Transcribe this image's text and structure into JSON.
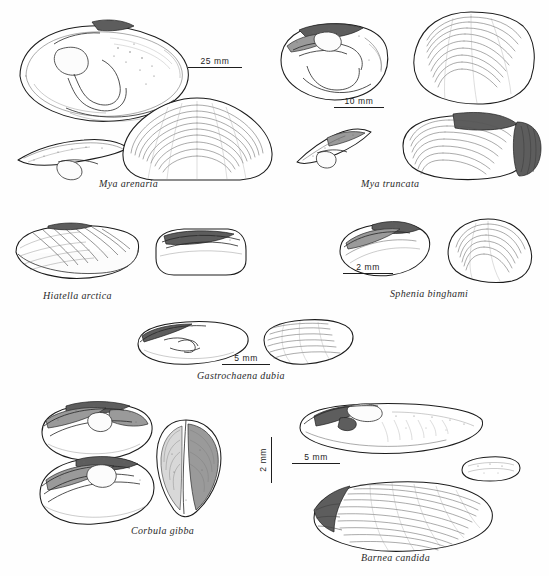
{
  "plate": {
    "title": "Bivalve shell identification plate",
    "background_color": "#ffffff",
    "ink_color": "#1c1c1c",
    "species_count": 6
  },
  "species": [
    {
      "id": "mya-arenaria",
      "label": "Mya arenaria",
      "scale": {
        "text": "25 mm",
        "orientation": "horizontal"
      },
      "views": [
        "left valve interior with chondrophore",
        "hinge plate detail",
        "right valve exterior"
      ]
    },
    {
      "id": "mya-truncata",
      "label": "Mya truncata",
      "scale": {
        "text": "10 mm",
        "orientation": "horizontal"
      },
      "views": [
        "left valve interior with chondrophore",
        "hinge plate detail",
        "valve exterior",
        "valve with periostracum"
      ]
    },
    {
      "id": "hiatella-arctica",
      "label": "Hiatella arctica",
      "scale": {
        "text": "2 mm",
        "orientation": "vertical"
      },
      "views": [
        "exterior",
        "interior"
      ]
    },
    {
      "id": "sphenia-binghami",
      "label": "Sphenia binghami",
      "scale": {
        "text": "2 mm",
        "orientation": "horizontal"
      },
      "views": [
        "interior",
        "exterior"
      ]
    },
    {
      "id": "gastrochaena-dubia",
      "label": "Gastrochaena dubia",
      "scale": {
        "text": "5 mm",
        "orientation": "horizontal"
      },
      "views": [
        "interior",
        "exterior"
      ]
    },
    {
      "id": "corbula-gibba",
      "label": "Corbula gibba",
      "scale": {
        "text": "5 mm",
        "orientation": "vertical"
      },
      "views": [
        "right valve interior",
        "left valve interior",
        "dorsal view of paired valves"
      ]
    },
    {
      "id": "barnea-candida",
      "label": "Barnea candida",
      "scale": {
        "text": "5 mm",
        "orientation": "horizontal"
      },
      "views": [
        "valve interior",
        "accessory plate",
        "valve exterior"
      ]
    }
  ]
}
